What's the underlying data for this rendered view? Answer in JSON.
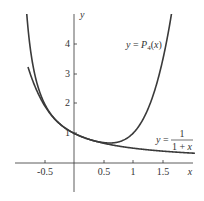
{
  "chart_data": {
    "type": "line",
    "title": "",
    "xlabel": "x",
    "ylabel": "y",
    "xlim": [
      -1.0,
      2.0
    ],
    "ylim": [
      -0.9,
      5.0
    ],
    "x_ticks": [
      "-0.5",
      "0.5",
      "1",
      "1.5"
    ],
    "y_ticks": [
      "1",
      "2",
      "3",
      "4"
    ],
    "grid": false,
    "series": [
      {
        "name": "y = P4(x)",
        "formula": "1 - x + x^2 - x^3 + x^4",
        "x": [
          -0.75,
          -0.5,
          -0.25,
          0,
          0.25,
          0.5,
          0.75,
          1.0,
          1.25,
          1.5,
          1.7
        ],
        "values": [
          3.05,
          1.94,
          1.33,
          1.0,
          0.8,
          0.69,
          0.68,
          1.0,
          2.05,
          4.81,
          5.63
        ]
      },
      {
        "name": "y = 1/(1+x)",
        "formula": "1/(1+x)",
        "x": [
          -0.8,
          -0.5,
          -0.25,
          0,
          0.25,
          0.5,
          0.75,
          1.0,
          1.5,
          2.0
        ],
        "values": [
          5.0,
          2.0,
          1.33,
          1.0,
          0.8,
          0.67,
          0.57,
          0.5,
          0.4,
          0.33
        ]
      }
    ],
    "annotations": [
      "y = P4(x)",
      "y = 1/(1+x)"
    ]
  },
  "labels": {
    "y_axis": "y",
    "x_axis": "x",
    "p4_label_prefix": "y = P",
    "p4_sub": "4",
    "p4_label_suffix": "(x)",
    "recip_prefix": "y =",
    "recip_num": "1",
    "recip_den": "1 + x"
  }
}
